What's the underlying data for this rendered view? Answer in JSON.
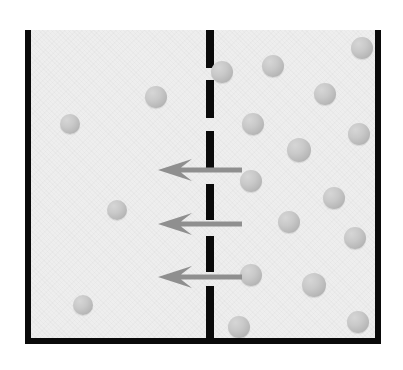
{
  "figure": {
    "caption": "",
    "background_color": "#ffffff",
    "solution_color": "#eeeeee",
    "wall_color": "#0a0a0a",
    "membrane_color": "#0a0a0a",
    "particle_color": "#bfbfbf",
    "arrow_color": "#8f8f8f"
  },
  "vessel": {
    "label": "solution-container",
    "x": 25,
    "y": 30,
    "width": 355,
    "height": 314,
    "walls": [
      {
        "name": "left-wall",
        "x": 25,
        "y": 30,
        "width": 6,
        "height": 314
      },
      {
        "name": "right-wall",
        "x": 375,
        "y": 30,
        "width": 6,
        "height": 314
      },
      {
        "name": "bottom-wall",
        "x": 25,
        "y": 338,
        "width": 356,
        "height": 6
      }
    ]
  },
  "membrane": {
    "label": "semipermeable-membrane",
    "x": 206,
    "orientation": "vertical",
    "style": "dashed",
    "dash_width": 8,
    "dashes": [
      {
        "top": 0,
        "height": 38
      },
      {
        "top": 50,
        "height": 38
      },
      {
        "top": 101,
        "height": 38
      },
      {
        "top": 154,
        "height": 36
      },
      {
        "top": 206,
        "height": 36
      },
      {
        "top": 256,
        "height": 52
      }
    ]
  },
  "arrows": [
    {
      "name": "flux-arrow-1",
      "x": 158,
      "y": 170,
      "length": 84,
      "direction": "left"
    },
    {
      "name": "flux-arrow-2",
      "x": 158,
      "y": 224,
      "length": 84,
      "direction": "left"
    },
    {
      "name": "flux-arrow-3",
      "x": 158,
      "y": 277,
      "length": 84,
      "direction": "left"
    }
  ],
  "particles": {
    "left_compartment_count": 5,
    "right_compartment_count": 18,
    "left": [
      {
        "cx": 70,
        "cy": 124,
        "r": 10
      },
      {
        "cx": 156,
        "cy": 97,
        "r": 11
      },
      {
        "cx": 117,
        "cy": 210,
        "r": 10
      },
      {
        "cx": 83,
        "cy": 305,
        "r": 10
      }
    ],
    "right": [
      {
        "cx": 222,
        "cy": 72,
        "r": 11
      },
      {
        "cx": 273,
        "cy": 66,
        "r": 11
      },
      {
        "cx": 362,
        "cy": 48,
        "r": 11
      },
      {
        "cx": 253,
        "cy": 124,
        "r": 11
      },
      {
        "cx": 325,
        "cy": 94,
        "r": 11
      },
      {
        "cx": 359,
        "cy": 134,
        "r": 11
      },
      {
        "cx": 299,
        "cy": 150,
        "r": 12
      },
      {
        "cx": 251,
        "cy": 181,
        "r": 11
      },
      {
        "cx": 334,
        "cy": 198,
        "r": 11
      },
      {
        "cx": 289,
        "cy": 222,
        "r": 11
      },
      {
        "cx": 355,
        "cy": 238,
        "r": 11
      },
      {
        "cx": 251,
        "cy": 275,
        "r": 11
      },
      {
        "cx": 314,
        "cy": 285,
        "r": 12
      },
      {
        "cx": 317,
        "cy": 213,
        "r": 0
      },
      {
        "cx": 239,
        "cy": 327,
        "r": 11
      },
      {
        "cx": 358,
        "cy": 322,
        "r": 11
      }
    ]
  }
}
